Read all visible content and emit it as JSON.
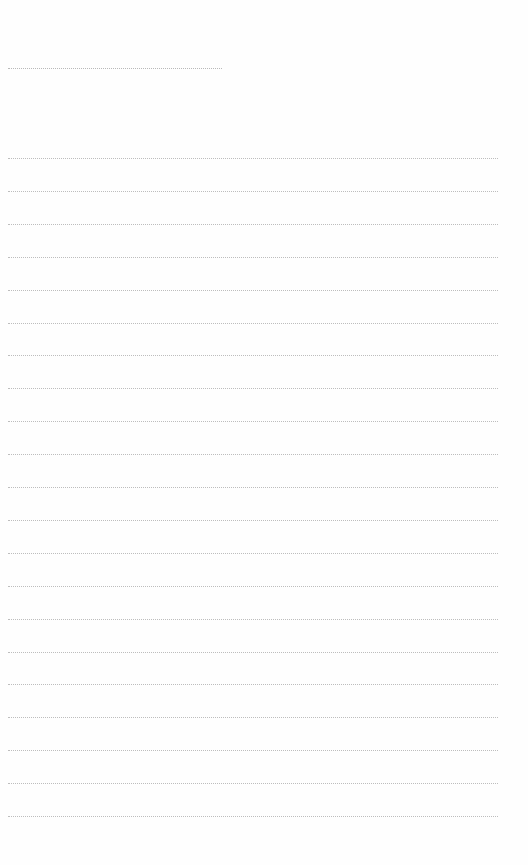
{
  "page": {
    "type": "blank-lined-sheet",
    "background": "#ffffff",
    "line_color": "#bdbdbd",
    "title_line": {
      "text": ""
    },
    "lines": [
      {
        "text": ""
      },
      {
        "text": ""
      },
      {
        "text": ""
      },
      {
        "text": ""
      },
      {
        "text": ""
      },
      {
        "text": ""
      },
      {
        "text": ""
      },
      {
        "text": ""
      },
      {
        "text": ""
      },
      {
        "text": ""
      },
      {
        "text": ""
      },
      {
        "text": ""
      },
      {
        "text": ""
      },
      {
        "text": ""
      },
      {
        "text": ""
      },
      {
        "text": ""
      },
      {
        "text": ""
      },
      {
        "text": ""
      },
      {
        "text": ""
      },
      {
        "text": ""
      },
      {
        "text": ""
      }
    ]
  }
}
